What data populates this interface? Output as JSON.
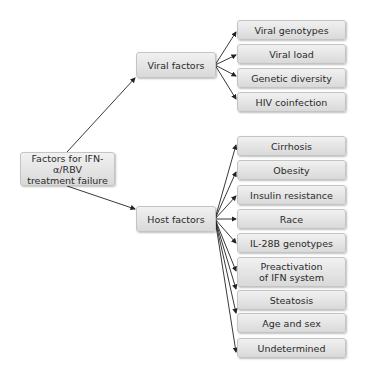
{
  "root": {
    "label": "Factors for IFN-α/RBV treatment failure",
    "line1": "Factors for IFN-α/RBV",
    "line2": "treatment failure"
  },
  "branches": [
    {
      "label": "Viral factors",
      "children": [
        "Viral genotypes",
        "Viral load",
        "Genetic diversity",
        "HIV coinfection"
      ]
    },
    {
      "label": "Host factors",
      "children": [
        "Cirrhosis",
        "Obesity",
        "Insulin resistance",
        "Race",
        "IL-28B genotypes",
        "Preactivation of IFN system",
        "Steatosis",
        "Age and sex",
        "Undetermined"
      ]
    }
  ],
  "preactivation": {
    "line1": "Preactivation",
    "line2": "of IFN system"
  },
  "colors": {
    "box_fill_top": "#f1f1f1",
    "box_fill_bottom": "#d9d9d9",
    "border": "#c4c4c4",
    "arrow": "#222222",
    "text": "#2a2a2a"
  }
}
